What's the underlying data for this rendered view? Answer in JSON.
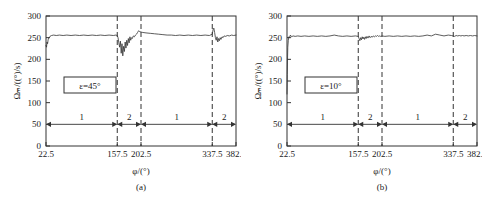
{
  "figure": {
    "panels": [
      {
        "id": "a",
        "caption": "(a)",
        "annotation": "ε=45°",
        "xlabel": "φ/(°)",
        "ylabel": "Ωₘ/((°)/s)"
      },
      {
        "id": "b",
        "caption": "(b)",
        "annotation": "ε=10°",
        "xlabel": "φ/(°)",
        "ylabel": "Ωₘ/((°)/s)"
      }
    ]
  },
  "chart_data": [
    {
      "type": "line",
      "title": "(a)",
      "xlabel": "φ/(°)",
      "ylabel": "Ωₘ/((°)/s)",
      "annotation": "ε=45°",
      "xlim": [
        22.5,
        382.5
      ],
      "ylim": [
        0,
        300
      ],
      "xticks": [
        22.5,
        157.5,
        202.5,
        337.5,
        382.5
      ],
      "xticklabels": [
        "22.5",
        "157.5",
        "202.5",
        "337.5",
        "382.5"
      ],
      "yticks": [
        0,
        50,
        100,
        150,
        200,
        250,
        300
      ],
      "yticklabels": [
        "0",
        "50",
        "100",
        "150",
        "200",
        "250",
        "300"
      ],
      "grid": false,
      "vertical_dashed_lines": [
        22.5,
        157.5,
        202.5,
        337.5,
        382.5
      ],
      "legend": "none",
      "segment_markers": [
        {
          "label": "1",
          "from": 22.5,
          "to": 157.5,
          "y": 50
        },
        {
          "label": "2",
          "from": 157.5,
          "to": 202.5,
          "y": 50
        },
        {
          "label": "1",
          "from": 202.5,
          "to": 337.5,
          "y": 50
        },
        {
          "label": "2",
          "from": 337.5,
          "to": 382.5,
          "y": 50
        }
      ],
      "x": [
        22.5,
        23.5,
        24.5,
        25.5,
        26.5,
        28,
        30,
        33,
        37,
        42,
        48,
        55,
        62,
        70,
        78,
        86,
        94,
        102,
        110,
        118,
        126,
        134,
        142,
        150,
        155,
        157.5,
        159,
        160.5,
        162,
        163.5,
        165,
        166.5,
        168,
        169.5,
        171,
        172.5,
        174,
        175.5,
        177,
        178.5,
        180,
        181.5,
        183,
        184.5,
        186,
        188,
        190,
        192,
        194,
        196,
        198,
        200,
        202.5,
        206,
        212,
        220,
        228,
        236,
        244,
        252,
        260,
        268,
        276,
        284,
        292,
        300,
        308,
        316,
        324,
        332,
        337.5,
        339,
        340.5,
        342,
        343.5,
        345,
        346.5,
        348,
        349.5,
        351,
        352.5,
        354,
        356,
        358,
        360,
        363,
        366,
        370,
        374,
        378,
        382.5
      ],
      "y": [
        232,
        228,
        240,
        236,
        245,
        250,
        253,
        255,
        256,
        255,
        256,
        255,
        256,
        255,
        256,
        255,
        256,
        255,
        256,
        255,
        256,
        255,
        256,
        255,
        256,
        255,
        250,
        238,
        228,
        242,
        214,
        236,
        208,
        230,
        218,
        240,
        226,
        244,
        232,
        248,
        238,
        252,
        244,
        250,
        248,
        254,
        252,
        256,
        258,
        262,
        266,
        264,
        263,
        262,
        261,
        260,
        259,
        258,
        257,
        256,
        256,
        255,
        256,
        255,
        256,
        255,
        256,
        255,
        256,
        255,
        258,
        268,
        272,
        262,
        250,
        244,
        252,
        240,
        248,
        243,
        250,
        246,
        252,
        250,
        254,
        253,
        255,
        254,
        256,
        255,
        256
      ],
      "series_color": "#333333"
    },
    {
      "type": "line",
      "title": "(b)",
      "xlabel": "φ/(°)",
      "ylabel": "Ωₘ/((°)/s)",
      "annotation": "ε=10°",
      "xlim": [
        22.5,
        382.5
      ],
      "ylim": [
        0,
        300
      ],
      "xticks": [
        22.5,
        157.5,
        202.5,
        337.5,
        382.5
      ],
      "xticklabels": [
        "22.5",
        "157.5",
        "202.5",
        "337.5",
        "382.5"
      ],
      "yticks": [
        0,
        50,
        100,
        150,
        200,
        250,
        300
      ],
      "yticklabels": [
        "0",
        "50",
        "100",
        "150",
        "200",
        "250",
        "300"
      ],
      "grid": false,
      "vertical_dashed_lines": [
        22.5,
        157.5,
        202.5,
        337.5,
        382.5
      ],
      "legend": "none",
      "segment_markers": [
        {
          "label": "1",
          "from": 22.5,
          "to": 157.5,
          "y": 50
        },
        {
          "label": "2",
          "from": 157.5,
          "to": 202.5,
          "y": 50
        },
        {
          "label": "1",
          "from": 202.5,
          "to": 337.5,
          "y": 50
        },
        {
          "label": "2",
          "from": 337.5,
          "to": 382.5,
          "y": 50
        }
      ],
      "x": [
        22.5,
        23,
        23.5,
        24,
        25,
        26,
        27,
        29,
        31,
        34,
        38,
        43,
        49,
        56,
        64,
        72,
        80,
        88,
        96,
        104,
        112,
        120,
        128,
        136,
        144,
        152,
        157.5,
        159,
        160.5,
        162,
        163.5,
        165,
        166.5,
        168,
        169.5,
        171,
        172.5,
        174,
        176,
        178,
        180,
        182,
        184,
        186,
        188,
        190,
        192,
        194,
        196,
        198,
        200,
        202.5,
        208,
        216,
        224,
        232,
        240,
        248,
        256,
        264,
        272,
        280,
        288,
        296,
        304,
        312,
        320,
        328,
        334,
        337.5,
        340,
        343,
        346,
        349,
        352,
        355,
        358,
        362,
        366,
        370,
        374,
        378,
        382.5
      ],
      "y": [
        120,
        165,
        200,
        228,
        244,
        252,
        250,
        256,
        252,
        254,
        253,
        254,
        253,
        254,
        253,
        254,
        253,
        254,
        253,
        254,
        256,
        254,
        253,
        254,
        253,
        254,
        253,
        248,
        243,
        250,
        245,
        252,
        247,
        251,
        246,
        252,
        248,
        253,
        249,
        254,
        250,
        253,
        251,
        254,
        252,
        254,
        253,
        255,
        253,
        254,
        253,
        254,
        253,
        254,
        253,
        254,
        253,
        254,
        253,
        254,
        253,
        254,
        256,
        254,
        258,
        256,
        254,
        256,
        255,
        254,
        253,
        255,
        254,
        255,
        254,
        255,
        254,
        255,
        254,
        255,
        254,
        255,
        254,
        255
      ],
      "series_color": "#333333"
    }
  ]
}
